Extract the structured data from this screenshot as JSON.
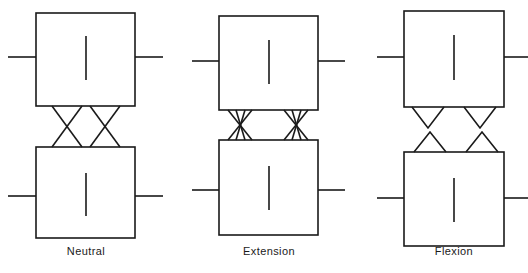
{
  "figure": {
    "background_color": "#ffffff",
    "stroke_color": "#1a1a1a",
    "stroke_width": 1.6
  },
  "panels": [
    {
      "id": "neutral",
      "label": "Neutral",
      "label_x": 86,
      "label_y": 245,
      "facet_pattern": "crossed-wide-x",
      "facet_description": "Two wide X crossings between upper and lower vertebral bodies",
      "upper_box": {
        "x": 36,
        "y": 13,
        "width": 99,
        "height": 93
      },
      "lower_box": {
        "x": 36,
        "y": 147,
        "width": 99,
        "height": 91
      },
      "upper_stub_y": 57,
      "lower_stub_y": 196,
      "left_stub_x": 8,
      "right_stub_x": 163,
      "upper_tick": {
        "x": 86,
        "y1": 36,
        "y2": 80
      },
      "lower_tick": {
        "x": 86,
        "y1": 173,
        "y2": 216
      },
      "crossings": [
        {
          "top_left": 52,
          "top_right": 82,
          "bottom_left": 52,
          "bottom_right": 82
        },
        {
          "top_left": 90,
          "top_right": 120,
          "bottom_left": 90,
          "bottom_right": 120
        }
      ]
    },
    {
      "id": "extension",
      "label": "Extension",
      "label_x": 269,
      "label_y": 245,
      "facet_pattern": "crossed-narrow-hourglass",
      "facet_description": "Two narrow compressed hourglass crossings, joint space reduced",
      "upper_box": {
        "x": 219,
        "y": 16,
        "width": 99,
        "height": 94
      },
      "lower_box": {
        "x": 219,
        "y": 140,
        "width": 99,
        "height": 95
      },
      "upper_stub_y": 61,
      "lower_stub_y": 190,
      "left_stub_x": 192,
      "right_stub_x": 345,
      "upper_tick": {
        "x": 269,
        "y1": 40,
        "y2": 84
      },
      "lower_tick": {
        "x": 269,
        "y1": 166,
        "y2": 210
      },
      "crossings": [
        {
          "top_left": 228,
          "top_right": 252,
          "bottom_left": 228,
          "bottom_right": 252
        },
        {
          "top_left": 284,
          "top_right": 308,
          "bottom_left": 284,
          "bottom_right": 308
        }
      ]
    },
    {
      "id": "flexion",
      "label": "Flexion",
      "label_x": 454,
      "label_y": 245,
      "facet_pattern": "open-v-and-lambda",
      "facet_description": "Two V shapes descending from upper body and two inverted V shapes rising from lower body, separated by a gap",
      "upper_box": {
        "x": 404,
        "y": 11,
        "width": 100,
        "height": 96
      },
      "lower_box": {
        "x": 404,
        "y": 152,
        "width": 100,
        "height": 94
      },
      "upper_stub_y": 57,
      "lower_stub_y": 198,
      "left_stub_x": 377,
      "right_stub_x": 530,
      "upper_tick": {
        "x": 454,
        "y1": 35,
        "y2": 80
      },
      "lower_tick": {
        "x": 454,
        "y1": 178,
        "y2": 222
      },
      "v_shapes": [
        {
          "left": 412,
          "right": 444,
          "apex_x": 428,
          "apex_y": 128
        },
        {
          "left": 464,
          "right": 496,
          "apex_x": 480,
          "apex_y": 128
        }
      ],
      "lambda_shapes": [
        {
          "left": 414,
          "right": 446,
          "apex_x": 430,
          "apex_y": 132
        },
        {
          "left": 466,
          "right": 498,
          "apex_x": 482,
          "apex_y": 132
        }
      ]
    }
  ]
}
